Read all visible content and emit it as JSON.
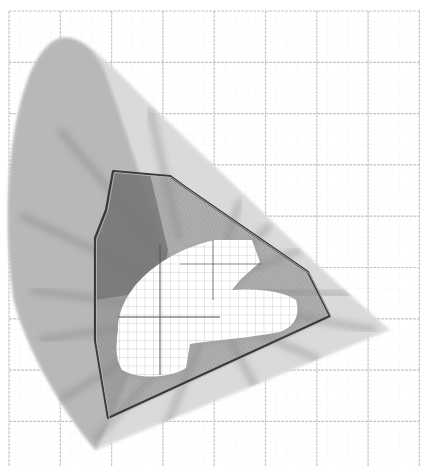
{
  "diagram": {
    "type": "chromaticity-gamut",
    "colors": {
      "background": "#ffffff",
      "grid_major": "#c8c8c8",
      "grid_minor": "#e2e2e2",
      "locus_light": "#d9d9d9",
      "locus_mid": "#b5b5b5",
      "gamut_fill": "#8c8c8c",
      "gamut_dark": "#6e6e6e",
      "gamut_stroke": "#3a3a3a",
      "hole": "#ffffff"
    },
    "grid": {
      "left": 9,
      "top": 11,
      "right": 420,
      "bottom": 467,
      "major_spacing": 51.3,
      "minor_divisions": 5
    },
    "locus_outline": "M96,450 C70,420 30,360 14,300 C4,230 6,140 28,80 C40,48 55,36 68,38 C85,40 100,55 118,72 C160,115 230,180 300,248 C340,286 370,312 390,330 Z",
    "locus_inner_dark": "M96,450 C70,420 30,360 14,300 C4,230 6,140 28,80 C40,48 55,36 68,38 C85,40 98,56 104,70 C130,140 150,210 170,260 C150,330 120,400 96,450 Z",
    "gamut_polygon": "113,171 170,176 185,187 308,272 330,316 108,418 95,340 95,238 106,210",
    "gamut_dark_region": "113,171 150,174 168,250 160,290 95,300 95,238 106,210",
    "hole_path": "M118,330 C118,290 160,252 215,240 L252,240 L260,262 L240,280 L232,290 C260,288 285,292 296,300 C300,314 296,326 280,332 C250,338 215,340 190,344 L186,368 C170,378 140,380 122,370 C115,358 116,345 118,330 Z",
    "spokes": [
      {
        "x1": 60,
        "y1": 130,
        "x2": 200,
        "y2": 300
      },
      {
        "x1": 20,
        "y1": 215,
        "x2": 200,
        "y2": 300
      },
      {
        "x1": 30,
        "y1": 290,
        "x2": 180,
        "y2": 310
      },
      {
        "x1": 40,
        "y1": 340,
        "x2": 170,
        "y2": 320
      },
      {
        "x1": 60,
        "y1": 400,
        "x2": 175,
        "y2": 330
      },
      {
        "x1": 95,
        "y1": 440,
        "x2": 185,
        "y2": 340
      },
      {
        "x1": 160,
        "y1": 440,
        "x2": 200,
        "y2": 345
      },
      {
        "x1": 210,
        "y1": 410,
        "x2": 210,
        "y2": 345
      },
      {
        "x1": 260,
        "y1": 395,
        "x2": 230,
        "y2": 340
      },
      {
        "x1": 320,
        "y1": 360,
        "x2": 250,
        "y2": 330
      },
      {
        "x1": 375,
        "y1": 330,
        "x2": 260,
        "y2": 310
      },
      {
        "x1": 350,
        "y1": 295,
        "x2": 260,
        "y2": 290
      },
      {
        "x1": 300,
        "y1": 250,
        "x2": 250,
        "y2": 270
      },
      {
        "x1": 270,
        "y1": 225,
        "x2": 240,
        "y2": 255
      },
      {
        "x1": 240,
        "y1": 200,
        "x2": 225,
        "y2": 245
      },
      {
        "x1": 150,
        "y1": 110,
        "x2": 180,
        "y2": 240
      }
    ]
  }
}
